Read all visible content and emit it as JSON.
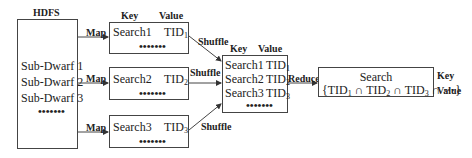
{
  "hdfs": {
    "title": "HDFS",
    "items": [
      "Sub-Dwarf 1",
      "Sub-Dwarf 2",
      "Sub-Dwarf 3"
    ],
    "ellipsis": "•••••••"
  },
  "map_stage": {
    "arrow_label": "Map",
    "key_header": "Key",
    "value_header": "Value",
    "boxes": [
      {
        "key": "Search1",
        "value": "TID",
        "sub": "1",
        "ellipsis": "•••••••"
      },
      {
        "key": "Search2",
        "value": "TID",
        "sub": "2",
        "ellipsis": "•••••••"
      },
      {
        "key": "Search3",
        "value": "TID",
        "sub": "3",
        "ellipsis": "•••••••"
      }
    ]
  },
  "shuffle_stage": {
    "arrow_label": "Shuffle",
    "key_header": "Key",
    "value_header": "Value",
    "rows": [
      {
        "key": "Search1",
        "value": "TID",
        "sub": "1"
      },
      {
        "key": "Search2",
        "value": "TID",
        "sub": "2"
      },
      {
        "key": "Search3",
        "value": "TID",
        "sub": "3"
      }
    ],
    "ellipsis": "•••••••"
  },
  "reduce_stage": {
    "arrow_label": "Reduce",
    "key": "Search",
    "value_open": "{TID",
    "sub1": "1",
    "cap1": " ∩ TID",
    "sub2": "2",
    "cap2": " ∩ TID",
    "sub3": "3",
    "value_close": " ∩ ⋯}",
    "key_label": "Key",
    "value_label": "Value"
  }
}
